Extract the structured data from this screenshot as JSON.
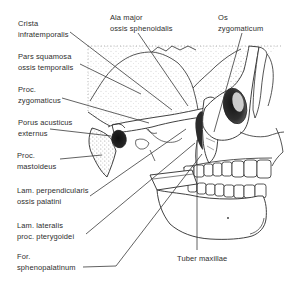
{
  "figure": {
    "type": "anatomical-line-drawing",
    "background_color": "#ffffff",
    "ink_color": "#2b2b2b",
    "label_color": "#2e2e2e",
    "leader_line_color": "#3a3a3a"
  },
  "labels": {
    "crista_infratemporalis": {
      "line1": "Crista",
      "line2": "infratemporalis"
    },
    "ala_major": {
      "line1": "Ala major",
      "line2": "ossis sphenoidalis"
    },
    "os_zygomaticum": {
      "line1": "Os",
      "line2": "zygomaticum"
    },
    "pars_squamosa": {
      "line1": "Pars squamosa",
      "line2": "ossis temporalis"
    },
    "proc_zygomaticus": {
      "line1": "Proc.",
      "line2": "zygomaticus"
    },
    "porus_acusticus": {
      "line1": "Porus acusticus",
      "line2": "externus"
    },
    "proc_mastoideus": {
      "line1": "Proc.",
      "line2": "mastoideus"
    },
    "lam_perpendicularis": {
      "line1": "Lam. perpendicularis",
      "line2": "ossis palatini"
    },
    "lam_lateralis": {
      "line1": "Lam. lateralis",
      "line2": "proc. pterygoidei"
    },
    "for_sphenopalatinum": {
      "line1": "For.",
      "line2": "sphenopalatinum"
    },
    "tuber_maxillae": {
      "line1": "Tuber maxillae"
    }
  }
}
